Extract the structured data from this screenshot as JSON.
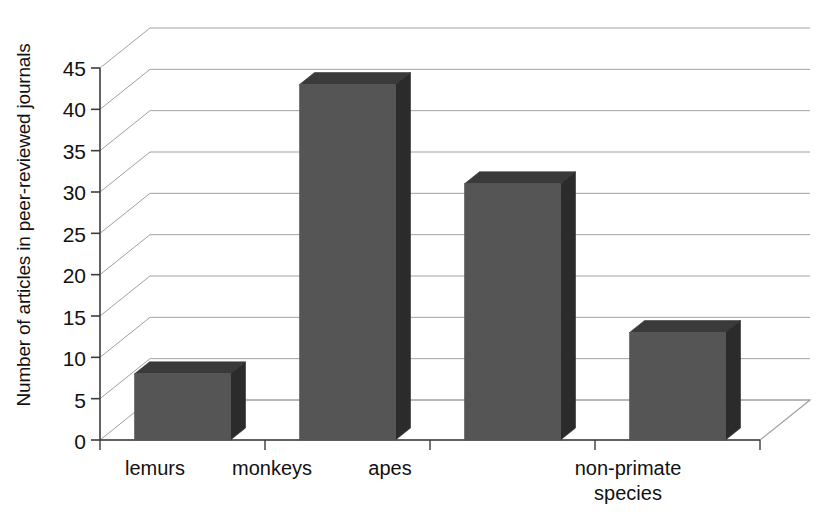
{
  "chart_data": {
    "type": "bar",
    "style": "3d-column",
    "title": "",
    "subtitle": "",
    "xlabel": "",
    "ylabel": "Number of articles in peer-reviewed journals",
    "categories": [
      "lemurs",
      "monkeys",
      "apes",
      "non-primate species"
    ],
    "category_lines": [
      [
        "lemurs"
      ],
      [
        "monkeys"
      ],
      [
        "apes"
      ],
      [
        "non-primate",
        "species"
      ]
    ],
    "values": [
      8,
      43,
      31,
      13
    ],
    "series": [
      {
        "name": "Number of articles in peer-reviewed journals",
        "values": [
          8,
          43,
          31,
          13
        ]
      }
    ],
    "ylim": [
      0,
      45
    ],
    "ytick_step": 5,
    "yticks": [
      0,
      5,
      10,
      15,
      20,
      25,
      30,
      35,
      40,
      45
    ],
    "ytick_labels": [
      "0",
      "5",
      "10",
      "15",
      "20",
      "25",
      "30",
      "35",
      "40",
      "45"
    ],
    "grid": true,
    "grid_axis": "y",
    "legend": false,
    "legend_position": "none",
    "annotations": [],
    "colors": {
      "bar_front": "#555555",
      "bar_side": "#2b2b2b",
      "bar_top": "#3a3a3a",
      "gridline": "#a0a0a0",
      "axis": "#3c3c3c",
      "background": "#ffffff",
      "text": "#111111"
    }
  }
}
